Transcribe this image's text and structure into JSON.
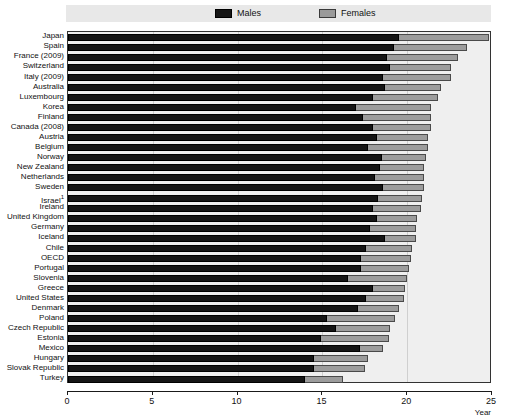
{
  "legend": {
    "items": [
      {
        "label": "Males",
        "key": "males",
        "color": "#151515",
        "swatch": "males-swatch"
      },
      {
        "label": "Females",
        "key": "females",
        "color": "#9c9c9c",
        "swatch": "females-swatch"
      }
    ]
  },
  "axis": {
    "xlabel": "Year",
    "ticks": [
      "0",
      "5",
      "10",
      "15",
      "20",
      "25"
    ],
    "xlim": [
      0,
      25
    ]
  },
  "chart_data": {
    "type": "bar",
    "orientation": "horizontal",
    "stacked": true,
    "title": "",
    "xlabel": "Year",
    "ylabel": "",
    "xlim": [
      0,
      25
    ],
    "grid": true,
    "legend_position": "top",
    "categories": [
      "Japan",
      "Spain",
      "France (2009)",
      "Switzerland",
      "Italy (2009)",
      "Australia",
      "Luxembourg",
      "Korea",
      "Finland",
      "Canada (2008)",
      "Austria",
      "Belgium",
      "Norway",
      "New Zealand",
      "Netherlands",
      "Sweden",
      "Israel",
      "Ireland",
      "United Kingdom",
      "Germany",
      "Iceland",
      "Chile",
      "OECD",
      "Portugal",
      "Slovenia",
      "Greece",
      "United States",
      "Denmark",
      "Poland",
      "Czech Republic",
      "Estonia",
      "Mexico",
      "Hungary",
      "Slovak Republic",
      "Turkey"
    ],
    "category_footnotes": {
      "Israel": "1"
    },
    "series": [
      {
        "name": "Males",
        "values": [
          19.5,
          19.2,
          18.8,
          19.0,
          18.6,
          18.7,
          18.0,
          17.0,
          17.4,
          18.0,
          18.2,
          17.7,
          18.5,
          18.4,
          18.1,
          18.6,
          18.3,
          18.0,
          18.2,
          17.8,
          18.7,
          17.6,
          17.3,
          17.3,
          16.5,
          18.0,
          17.6,
          17.1,
          15.3,
          15.8,
          14.9,
          17.2,
          14.5,
          14.5,
          14.0
        ]
      },
      {
        "name": "Females",
        "values": [
          5.3,
          4.3,
          4.2,
          3.6,
          4.0,
          3.3,
          3.8,
          4.4,
          4.0,
          3.4,
          3.0,
          3.5,
          2.6,
          2.6,
          2.9,
          2.4,
          2.6,
          2.8,
          2.4,
          2.7,
          1.8,
          2.7,
          2.9,
          2.8,
          3.5,
          1.9,
          2.2,
          2.4,
          4.0,
          3.2,
          4.0,
          1.4,
          3.2,
          3.0,
          2.2
        ]
      }
    ],
    "totals": [
      24.8,
      23.5,
      23.0,
      22.6,
      22.6,
      22.0,
      21.8,
      21.4,
      21.4,
      21.4,
      21.2,
      21.2,
      21.1,
      21.0,
      21.0,
      21.0,
      20.9,
      20.8,
      20.6,
      20.5,
      20.5,
      20.3,
      20.2,
      20.1,
      20.0,
      19.9,
      19.8,
      19.5,
      19.3,
      19.0,
      18.9,
      18.6,
      17.7,
      17.5,
      16.2
    ]
  }
}
